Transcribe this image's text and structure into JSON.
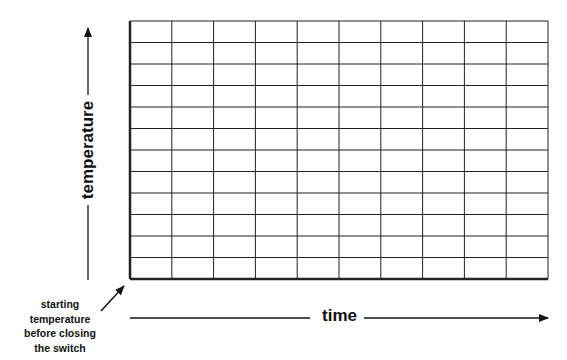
{
  "chart_data": {
    "type": "line",
    "title": "",
    "xlabel": "time",
    "ylabel": "temperature",
    "grid": true,
    "grid_columns": 10,
    "grid_rows": 12,
    "series": [],
    "x_ticks": [],
    "y_ticks": [],
    "annotations": [
      {
        "text": "starting temperature before closing the switch",
        "points_to": "origin"
      }
    ],
    "legend": null
  },
  "labels": {
    "y_axis": "temperature",
    "x_axis": "time",
    "annotation_lines": [
      "starting",
      "temperature",
      "before closing",
      "the switch"
    ]
  },
  "colors": {
    "line": "#222222",
    "background": "#ffffff"
  }
}
